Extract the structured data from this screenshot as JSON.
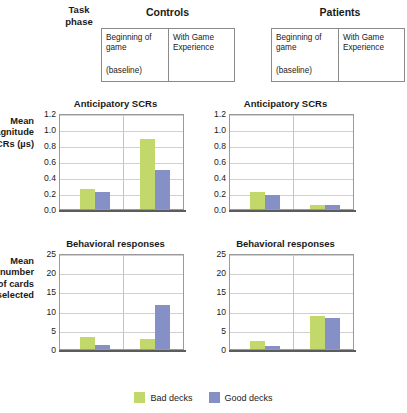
{
  "figure": {
    "task_phase_label": "Task\nphase",
    "task_phase_line1": "Task",
    "task_phase_line2": "phase"
  },
  "groups": [
    {
      "name": "controls",
      "title": "Controls"
    },
    {
      "name": "patients",
      "title": "Patients"
    }
  ],
  "phase_table": {
    "cell1_line1": "Beginning of",
    "cell1_line2": "game",
    "cell1_sub": "(baseline)",
    "cell2_line1": "With Game",
    "cell2_line2": "Experience"
  },
  "legend": {
    "items": [
      {
        "label": "Bad decks",
        "color": "#c3d86a"
      },
      {
        "label": "Good decks",
        "color": "#8591c6"
      }
    ]
  },
  "colors": {
    "bad_decks": "#c3d86a",
    "good_decks": "#8591c6",
    "axis": "#9a9a9a",
    "grid": "#d0d0d0",
    "text": "#1a1a1a"
  },
  "chart_data": [
    {
      "id": "controls-scr",
      "type": "bar",
      "title": "Anticipatory SCRs",
      "group": "Controls",
      "ylabel": "Mean magnitude of SCRs (µs)",
      "ylabel_lines": [
        "Mean",
        "magnitude",
        "of SCRs (µs)"
      ],
      "xlabel": "",
      "categories": [
        "Beginning of game (baseline)",
        "With Game Experience"
      ],
      "ticks": [
        "0.0",
        "0.2",
        "0.4",
        "0.6",
        "0.8",
        "1.0",
        "1.2"
      ],
      "ylim": [
        0,
        1.2
      ],
      "grid": true,
      "legend_position": "bottom",
      "series": [
        {
          "name": "Bad decks",
          "color": "#c3d86a",
          "values": [
            0.25,
            0.87
          ]
        },
        {
          "name": "Good decks",
          "color": "#8591c6",
          "values": [
            0.21,
            0.49
          ]
        }
      ]
    },
    {
      "id": "patients-scr",
      "type": "bar",
      "title": "Anticipatory SCRs",
      "group": "Patients",
      "ylabel": "Mean magnitude of SCRs (µs)",
      "xlabel": "",
      "categories": [
        "Beginning of game (baseline)",
        "With Game Experience"
      ],
      "ticks": [
        "0.0",
        "0.2",
        "0.4",
        "0.6",
        "0.8",
        "1.0",
        "1.2"
      ],
      "ylim": [
        0,
        1.2
      ],
      "grid": true,
      "legend_position": "bottom",
      "series": [
        {
          "name": "Bad decks",
          "color": "#c3d86a",
          "values": [
            0.21,
            0.05
          ]
        },
        {
          "name": "Good decks",
          "color": "#8591c6",
          "values": [
            0.17,
            0.05
          ]
        }
      ]
    },
    {
      "id": "controls-behavior",
      "type": "bar",
      "title": "Behavioral responses",
      "group": "Controls",
      "ylabel": "Mean number of cards selected",
      "ylabel_lines": [
        "Mean",
        "number",
        "of cards",
        "selected"
      ],
      "xlabel": "",
      "categories": [
        "Beginning of game (baseline)",
        "With Game Experience"
      ],
      "ticks": [
        "0",
        "5",
        "10",
        "15",
        "20",
        "25"
      ],
      "ylim": [
        0,
        25
      ],
      "grid": true,
      "legend_position": "bottom",
      "series": [
        {
          "name": "Bad decks",
          "color": "#c3d86a",
          "values": [
            3.0,
            2.6
          ]
        },
        {
          "name": "Good decks",
          "color": "#8591c6",
          "values": [
            1.0,
            11.5
          ]
        }
      ]
    },
    {
      "id": "patients-behavior",
      "type": "bar",
      "title": "Behavioral responses",
      "group": "Patients",
      "ylabel": "Mean number of cards selected",
      "xlabel": "",
      "categories": [
        "Beginning of game (baseline)",
        "With Game Experience"
      ],
      "ticks": [
        "0",
        "5",
        "10",
        "15",
        "20",
        "25"
      ],
      "ylim": [
        0,
        25
      ],
      "grid": true,
      "legend_position": "bottom",
      "series": [
        {
          "name": "Bad decks",
          "color": "#c3d86a",
          "values": [
            2.2,
            8.7
          ]
        },
        {
          "name": "Good decks",
          "color": "#8591c6",
          "values": [
            0.7,
            8.0
          ]
        }
      ]
    }
  ]
}
